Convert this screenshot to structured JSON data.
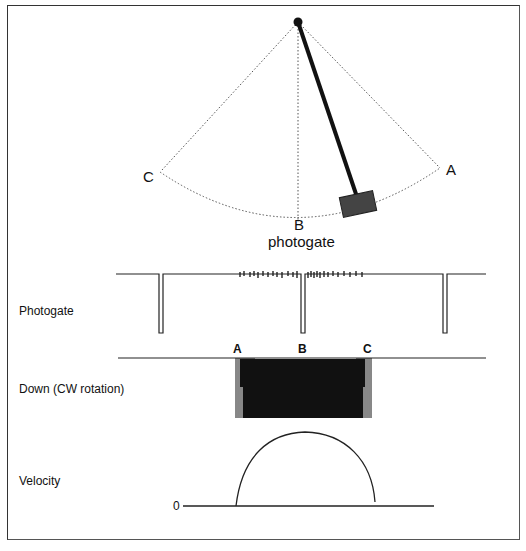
{
  "diagram": {
    "pendulum": {
      "points": [
        {
          "label": "C",
          "x": 148,
          "y": 181
        },
        {
          "label": "A",
          "x": 452,
          "y": 175
        },
        {
          "label": "B",
          "x": 300,
          "y": 230
        }
      ],
      "photogate_label": "photogate",
      "pivot": {
        "x": 298,
        "y": 22
      },
      "bob_color": "#444444"
    },
    "traces": {
      "photogate": {
        "label": "Photogate"
      },
      "down": {
        "label": "Down (CW rotation)",
        "markers": [
          "A",
          "B",
          "C"
        ]
      },
      "velocity": {
        "label": "Velocity",
        "zero_label": "0"
      }
    }
  }
}
